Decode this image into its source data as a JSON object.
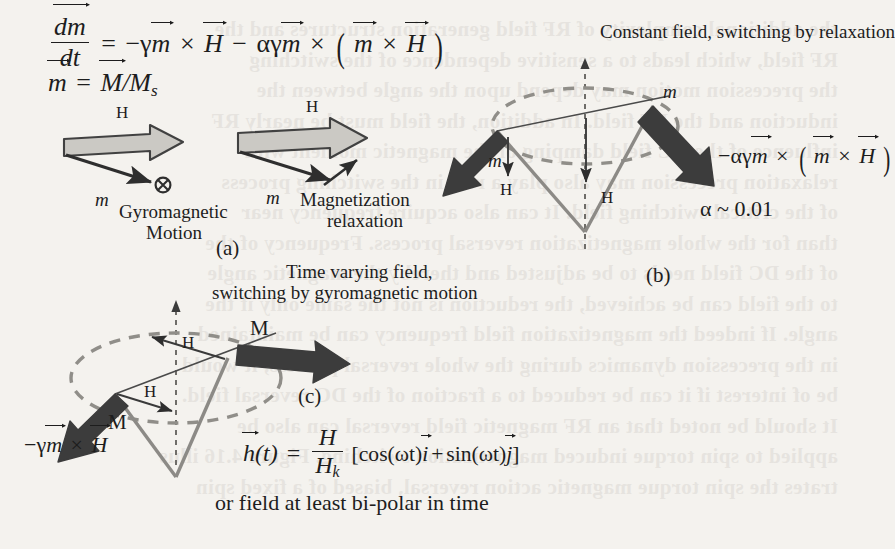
{
  "figure": {
    "colors": {
      "page": "#f4f2ee",
      "ink": "#1d1d1d",
      "gray_arrow_fill": "#c9c7c2",
      "gray_arrow_stroke": "#3a3a3a",
      "dark_arrow": "#3b3b3b",
      "dashed_orbit": "#8e8c87",
      "cone_vector": "#8a8884"
    }
  },
  "equations": {
    "llg": {
      "lhs_num": "dm",
      "lhs_den": "dt",
      "equals": "=",
      "term1_coeff": "−γ",
      "term1_m": "m",
      "cross1": "×",
      "term1_H": "H",
      "minus": "−",
      "term2_coeff": "αγ",
      "term2_m": "m",
      "cross2": "×",
      "paren_open": "(",
      "term2_inner_m": "m",
      "cross3": "×",
      "term2_inner_H": "H",
      "paren_close": ")"
    },
    "m_def": {
      "m": "m",
      "equals": "=",
      "M": "M",
      "slash": "/",
      "Ms_base": "M",
      "Ms_sub": "s"
    },
    "damping_term": {
      "coeff": "−αγ",
      "m": "m",
      "cross1": "×",
      "paren_open": "(",
      "inner_m": "m",
      "cross2": "×",
      "inner_H": "H",
      "paren_close": ")"
    },
    "precession_term": {
      "coeff": "−γ",
      "m": "m",
      "cross": "×",
      "H": "H"
    },
    "field_time": {
      "h": "h",
      "of_t": "(t)",
      "equals": "=",
      "num": "H",
      "den_base": "H",
      "den_sub": "k",
      "bracket_open": "[",
      "cos": "cos(ωt)",
      "i": "i",
      "plus": "+",
      "sin": "sin(ωt)",
      "j": "j",
      "bracket_close": "]"
    }
  },
  "panel_a": {
    "id": "(a)",
    "left": {
      "field_label": "H",
      "moment_label": "m",
      "caption_line1": "Gyromagnetic",
      "caption_line2": "Motion",
      "into_page_symbol": "⊗"
    },
    "right": {
      "field_label": "H",
      "moment_label": "m",
      "caption_line1": "Magnetization",
      "caption_line2": "relaxation"
    }
  },
  "panel_b": {
    "id": "(b)",
    "heading": "Constant field, switching by relaxation",
    "moment_label_top": "m",
    "moment_label_left": "m",
    "field_label_left": "H",
    "field_label_center": "H",
    "alpha_note": "α ~ 0.01"
  },
  "panel_c": {
    "id": "(c)",
    "heading_line1": "Time varying field,",
    "heading_line2": "switching by gyromagnetic motion",
    "magnetization_label_top": "M",
    "magnetization_label_left": "M",
    "field_label_upper": "H",
    "field_label_lower": "H",
    "footer": "or field at least bi-polar in time"
  },
  "background_showthrough": [
    "the additional complexity of RF field generation structures and the",
    "RF field, which leads to a sensitive dependence of the switching",
    "the precession motion may depend upon the angle between the",
    "induction and the RF field. In addition, the field must be nearly RF",
    "influence of the DC field damping of the magnetic moment with",
    "relaxation precession may also play a role in the switching process",
    "of the critical switching field. It can also acquire frequency near",
    "than for the whole magnetization reversal process. Frequency of the",
    "of the DC field needs to be adjusted and thereby the magnetic angle",
    "to the field can be achieved, the reduction is not the same only if the",
    "angle. If indeed the magnetization field frequency can be maintained",
    "in the precession dynamics during the whole reversal process, it would",
    "be of interest if it can be reduced to a fraction of the DC reversal field.",
    "It should be noted that an RF magnetic field reversal can also be",
    "applied to spin torque induced magnetization switching. Figure 4.16 illus",
    "trates the spin torque magnetic action reversal, biased of a fixed spin"
  ]
}
